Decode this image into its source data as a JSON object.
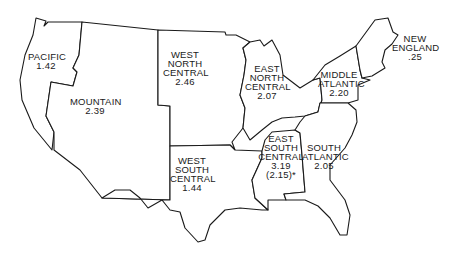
{
  "map": {
    "type": "us-census-divisions",
    "regions": [
      {
        "id": "pacific",
        "name_lines": [
          "PACIFIC"
        ],
        "value": "1.42"
      },
      {
        "id": "mountain",
        "name_lines": [
          "MOUNTAIN"
        ],
        "value": "2.39"
      },
      {
        "id": "west-north-central",
        "name_lines": [
          "WEST",
          "NORTH",
          "CENTRAL"
        ],
        "value": "2.46"
      },
      {
        "id": "east-north-central",
        "name_lines": [
          "EAST",
          "NORTH",
          "CENTRAL"
        ],
        "value": "2.07"
      },
      {
        "id": "middle-atlantic",
        "name_lines": [
          "MIDDLE",
          "ATLANTIC"
        ],
        "value": "2.20"
      },
      {
        "id": "new-england",
        "name_lines": [
          "NEW",
          "ENGLAND"
        ],
        "value": ".25"
      },
      {
        "id": "west-south-central",
        "name_lines": [
          "WEST",
          "SOUTH",
          "CENTRAL"
        ],
        "value": "1.44"
      },
      {
        "id": "east-south-central",
        "name_lines": [
          "EAST",
          "SOUTH",
          "CENTRAL"
        ],
        "value": "3.19",
        "note": "(2.15)*"
      },
      {
        "id": "south-atlantic",
        "name_lines": [
          "SOUTH",
          "ATLANTIC"
        ],
        "value": "2.05"
      }
    ]
  },
  "colors": {
    "outline": "#1a1a1a",
    "fill": "#ffffff"
  }
}
